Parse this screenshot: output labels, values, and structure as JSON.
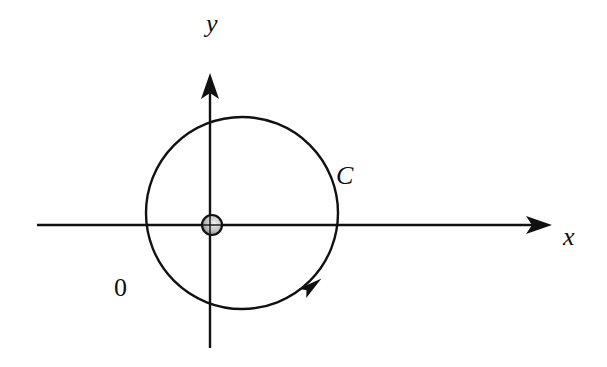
{
  "diagram": {
    "type": "physics-coordinate-diagram",
    "labels": {
      "x_axis": "x",
      "y_axis": "y",
      "curve": "C",
      "origin": "0"
    },
    "colors": {
      "stroke": "#111111",
      "background": "#ffffff",
      "ball_light": "#e8e8e8",
      "ball_dark": "#7a7a7a"
    },
    "geometry": {
      "x_axis": {
        "x1": 37,
        "y": 225,
        "x2": 552
      },
      "y_axis": {
        "x": 210,
        "y1": 348,
        "y2": 73
      },
      "circle": {
        "cx": 242,
        "cy": 213,
        "r": 96
      },
      "particle": {
        "cx": 212,
        "cy": 225,
        "r": 10
      },
      "direction_arrow": {
        "x": 312,
        "y": 286,
        "angle_deg": -38
      }
    },
    "elements": [
      {
        "name": "x-axis",
        "kind": "arrow",
        "direction": "right"
      },
      {
        "name": "y-axis",
        "kind": "arrow",
        "direction": "up"
      },
      {
        "name": "path-C",
        "kind": "circle",
        "orientation": "counterclockwise"
      },
      {
        "name": "particle",
        "kind": "sphere",
        "location": "origin"
      }
    ]
  }
}
